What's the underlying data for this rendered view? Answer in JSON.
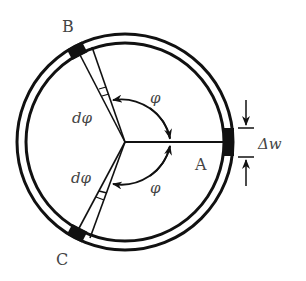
{
  "diagram": {
    "type": "ring-section-diagram",
    "labels": {
      "point_a": "A",
      "point_b": "B",
      "point_c": "C",
      "angle_upper": "φ",
      "angle_lower": "φ",
      "dphi_upper": "dφ",
      "dphi_lower": "dφ",
      "thickness": "Δw"
    },
    "colors": {
      "stroke": "#111111",
      "text": "#444444",
      "background": "#ffffff"
    }
  }
}
